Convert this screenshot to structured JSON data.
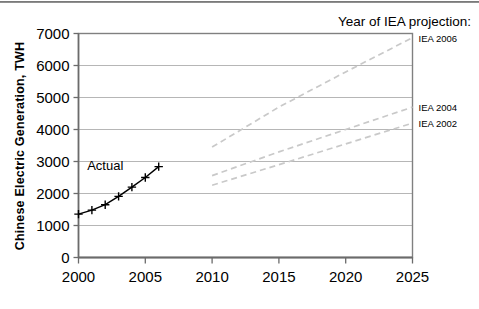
{
  "chart_data": {
    "type": "line",
    "title": "",
    "xlabel": "",
    "ylabel": "Chinese Electric Generation, TWH",
    "xlim": [
      2000,
      2025
    ],
    "ylim": [
      0,
      7000
    ],
    "xticks": [
      2000,
      2005,
      2010,
      2015,
      2020,
      2025
    ],
    "xtick_labels": [
      "2000",
      "2005",
      "2010",
      "2015",
      "2020",
      "2025"
    ],
    "yticks": [
      0,
      1000,
      2000,
      3000,
      4000,
      5000,
      6000,
      7000
    ],
    "ytick_labels": [
      "0",
      "1000",
      "2000",
      "3000",
      "4000",
      "5000",
      "6000",
      "7000"
    ],
    "grid": "horizontal",
    "legend_position": "right-of-plot",
    "legend_title": "Year of IEA projection:",
    "series": [
      {
        "name": "Actual",
        "style": "solid-black-plus-markers",
        "color": "#000000",
        "x": [
          2000,
          2001,
          2002,
          2003,
          2004,
          2005,
          2006
        ],
        "values": [
          1355,
          1480,
          1650,
          1910,
          2200,
          2500,
          2840
        ]
      },
      {
        "name": "IEA 2006",
        "style": "dashed-gray",
        "color": "#c9c9c9",
        "x": [
          2010,
          2015,
          2020,
          2025
        ],
        "values": [
          3450,
          4700,
          5800,
          6870
        ]
      },
      {
        "name": "IEA 2004",
        "style": "dashed-gray",
        "color": "#c9c9c9",
        "x": [
          2010,
          2015,
          2020,
          2025
        ],
        "values": [
          2560,
          3300,
          4000,
          4700
        ]
      },
      {
        "name": "IEA 2002",
        "style": "dashed-gray",
        "color": "#c9c9c9",
        "x": [
          2010,
          2015,
          2020,
          2025
        ],
        "values": [
          2260,
          2900,
          3550,
          4200
        ]
      }
    ],
    "annotations": [
      {
        "text": "Actual",
        "x": 2002.0,
        "y": 2720
      }
    ],
    "series_end_labels": [
      {
        "text": "IEA 2006",
        "y": 6870
      },
      {
        "text": "IEA 2004",
        "y": 4700
      },
      {
        "text": "IEA 2002",
        "y": 4200
      }
    ]
  }
}
